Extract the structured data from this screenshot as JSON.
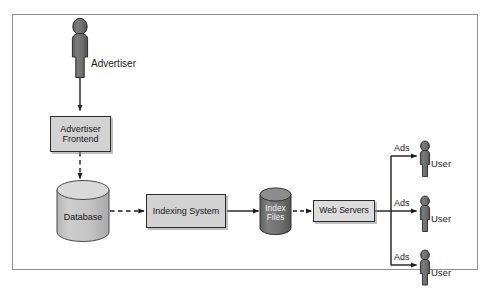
{
  "figure": {
    "type": "block-diagram",
    "frame": {
      "border_color": "#8e8e8e",
      "background": "#ffffff"
    }
  },
  "colors": {
    "box_fill": "#d2d2d2",
    "box_stroke": "#2b2b2b",
    "cylinder_light_fill": "#c2c2c2",
    "cylinder_light_top": "#d8d8d8",
    "cylinder_dark_fill": "#6f6f6f",
    "cylinder_dark_top": "#8a8a8a",
    "person_fill": "#6e6e6e",
    "person_stroke": "#2b2b2b",
    "arrow_color": "#1c1c1c",
    "text_color": "#1a1a1a",
    "shadow_color": "#8c8c8c"
  },
  "actors": [
    {
      "id": "advertiser",
      "label": "Advertiser",
      "icon": "person-icon"
    },
    {
      "id": "user-1",
      "label": "User",
      "icon": "person-icon"
    },
    {
      "id": "user-2",
      "label": "User",
      "icon": "person-icon"
    },
    {
      "id": "user-3",
      "label": "User",
      "icon": "person-icon"
    }
  ],
  "nodes": [
    {
      "id": "advertiser-frontend",
      "shape": "box",
      "line1": "Advertiser",
      "line2": "Frontend"
    },
    {
      "id": "database",
      "shape": "cylinder",
      "label": "Database",
      "fill": "light"
    },
    {
      "id": "indexing-system",
      "shape": "box",
      "line1": "Indexing System",
      "line2": ""
    },
    {
      "id": "index-files",
      "shape": "cylinder",
      "label_line1": "Index",
      "label_line2": "Files",
      "fill": "dark"
    },
    {
      "id": "web-servers",
      "shape": "box",
      "line1": "Web Servers",
      "line2": ""
    }
  ],
  "edges": [
    {
      "id": "advertiser-to-frontend",
      "from": "advertiser",
      "to": "advertiser-frontend",
      "style": "solid",
      "label": ""
    },
    {
      "id": "frontend-to-database",
      "from": "advertiser-frontend",
      "to": "database",
      "style": "dashed",
      "label": ""
    },
    {
      "id": "database-to-indexing",
      "from": "database",
      "to": "indexing-system",
      "style": "dashed",
      "label": ""
    },
    {
      "id": "indexing-to-indexfiles",
      "from": "indexing-system",
      "to": "index-files",
      "style": "solid",
      "label": ""
    },
    {
      "id": "indexfiles-to-webservers",
      "from": "index-files",
      "to": "web-servers",
      "style": "dashed",
      "label": ""
    },
    {
      "id": "webservers-to-user-1",
      "from": "web-servers",
      "to": "user-1",
      "style": "solid",
      "label": "Ads"
    },
    {
      "id": "webservers-to-user-2",
      "from": "web-servers",
      "to": "user-2",
      "style": "solid",
      "label": "Ads"
    },
    {
      "id": "webservers-to-user-3",
      "from": "web-servers",
      "to": "user-3",
      "style": "solid",
      "label": "Ads"
    }
  ]
}
